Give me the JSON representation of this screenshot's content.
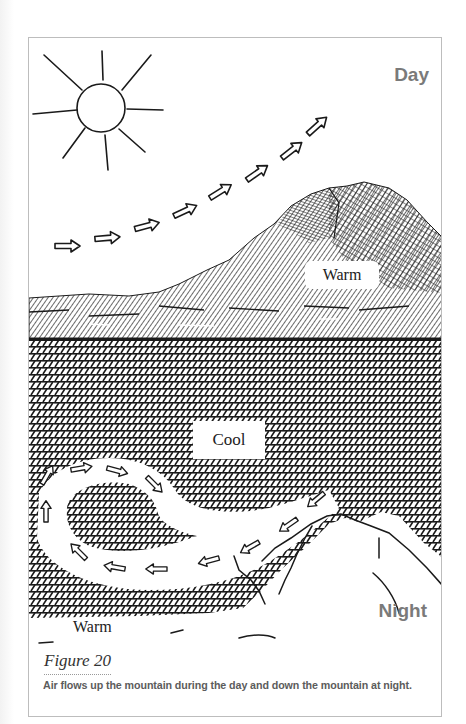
{
  "figure": {
    "title": "Figure 20",
    "caption": "Air flows up the mountain during the day and down the mountain at night."
  },
  "panels": {
    "day": {
      "label": "Day",
      "zone_label": "Warm",
      "elements": [
        "sun-icon",
        "upslope-wind-arrows",
        "hatched-mountain"
      ],
      "arrow_count": 8
    },
    "night": {
      "label": "Night",
      "air_label": "Cool",
      "ground_label": "Warm",
      "elements": [
        "crosshatched-sky",
        "downslope-wind-arrows",
        "circulation-loop",
        "outline-mountain"
      ],
      "arrow_count": 11
    }
  },
  "colors": {
    "ink": "#1a1a1a",
    "label_gray": "#7a7a7a",
    "caption_gray": "#5c5c5c",
    "frame_border": "#bdbdbd"
  }
}
